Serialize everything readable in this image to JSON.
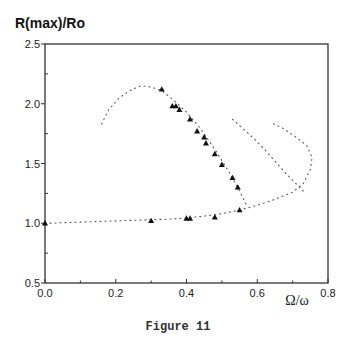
{
  "figure": {
    "caption": "Figure 11"
  },
  "chart_data": {
    "type": "scatter",
    "title": "",
    "ylabel": "R(max)/Ro",
    "xlabel": "Ω/ω",
    "xlim": [
      0.0,
      0.8
    ],
    "ylim": [
      0.5,
      2.5
    ],
    "x_ticks": [
      "0.0",
      "0.2",
      "0.4",
      "0.6",
      "0.8"
    ],
    "y_ticks": [
      "0.5",
      "1.0",
      "1.5",
      "2.0",
      "2.5"
    ],
    "grid": false,
    "legend": null,
    "series": [
      {
        "name": "theory (dotted curve, lower branch + resonance peak)",
        "style": "dotted",
        "points": [
          [
            0.0,
            1.0
          ],
          [
            0.05,
            1.005
          ],
          [
            0.1,
            1.01
          ],
          [
            0.15,
            1.015
          ],
          [
            0.2,
            1.02
          ],
          [
            0.25,
            1.025
          ],
          [
            0.3,
            1.03
          ],
          [
            0.35,
            1.035
          ],
          [
            0.4,
            1.045
          ],
          [
            0.45,
            1.06
          ],
          [
            0.5,
            1.08
          ],
          [
            0.55,
            1.11
          ],
          [
            0.6,
            1.15
          ],
          [
            0.65,
            1.2
          ],
          [
            0.7,
            1.26
          ],
          [
            0.73,
            1.33
          ],
          [
            0.75,
            1.45
          ],
          [
            0.755,
            1.55
          ],
          [
            0.74,
            1.65
          ],
          [
            0.71,
            1.72
          ],
          [
            0.67,
            1.8
          ],
          [
            0.64,
            1.84
          ]
        ]
      },
      {
        "name": "theory (dotted curve, middle branch)",
        "style": "dotted",
        "points": [
          [
            0.53,
            1.87
          ],
          [
            0.56,
            1.79
          ],
          [
            0.59,
            1.71
          ],
          [
            0.62,
            1.62
          ],
          [
            0.65,
            1.52
          ],
          [
            0.68,
            1.42
          ],
          [
            0.71,
            1.33
          ],
          [
            0.73,
            1.27
          ]
        ]
      },
      {
        "name": "theory (dotted curve, upper branch)",
        "style": "dotted",
        "points": [
          [
            0.16,
            1.83
          ],
          [
            0.18,
            1.95
          ],
          [
            0.21,
            2.05
          ],
          [
            0.24,
            2.11
          ],
          [
            0.27,
            2.15
          ],
          [
            0.3,
            2.14
          ],
          [
            0.33,
            2.11
          ],
          [
            0.36,
            2.04
          ],
          [
            0.4,
            1.93
          ],
          [
            0.44,
            1.79
          ],
          [
            0.48,
            1.62
          ],
          [
            0.52,
            1.43
          ],
          [
            0.55,
            1.27
          ],
          [
            0.57,
            1.15
          ]
        ]
      },
      {
        "name": "experiment (triangles)",
        "style": "triangle",
        "points": [
          [
            0.0,
            1.0
          ],
          [
            0.3,
            1.02
          ],
          [
            0.4,
            1.04
          ],
          [
            0.41,
            1.04
          ],
          [
            0.48,
            1.05
          ],
          [
            0.55,
            1.11
          ],
          [
            0.33,
            2.12
          ],
          [
            0.36,
            1.98
          ],
          [
            0.37,
            1.98
          ],
          [
            0.38,
            1.95
          ],
          [
            0.41,
            1.87
          ],
          [
            0.43,
            1.77
          ],
          [
            0.45,
            1.72
          ],
          [
            0.455,
            1.67
          ],
          [
            0.48,
            1.58
          ],
          [
            0.5,
            1.49
          ],
          [
            0.53,
            1.38
          ],
          [
            0.545,
            1.3
          ]
        ]
      }
    ]
  }
}
